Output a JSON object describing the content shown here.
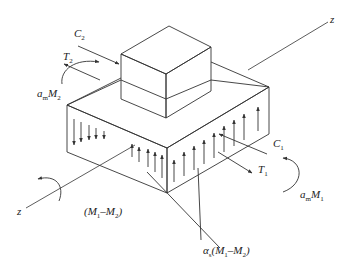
{
  "figure": {
    "type": "isometric force diagram",
    "labels": {
      "c2": {
        "main": "C",
        "sub": "2"
      },
      "t2": {
        "main": "T",
        "sub": "2"
      },
      "am_m2": {
        "prefix": "a",
        "prefix_sub": "m",
        "main": "M",
        "sub": "2"
      },
      "c1": {
        "main": "C",
        "sub": "1"
      },
      "t1": {
        "main": "T",
        "sub": "1"
      },
      "am_m1": {
        "prefix": "a",
        "prefix_sub": "m",
        "main": "M",
        "sub": "1"
      },
      "z_right": "z",
      "z_left": "z",
      "m_diff": {
        "open": "(",
        "m1": "M",
        "s1": "1",
        "dash": "–",
        "m2": "M",
        "s2": "2",
        "close": ")"
      },
      "as_m_diff": {
        "prefix": "α",
        "prefix_sub": "s",
        "open": "(",
        "m1": "M",
        "s1": "1",
        "dash": "–",
        "m2": "M",
        "s2": "2",
        "close": ")"
      }
    },
    "colors": {
      "line": "#333333",
      "text": "#222222",
      "background": "#ffffff"
    }
  }
}
